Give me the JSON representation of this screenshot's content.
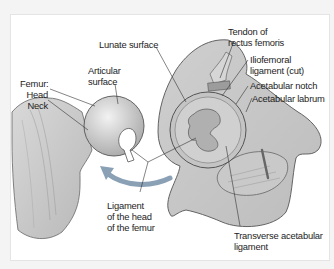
{
  "figure": {
    "arrow_color": "#8aa0b5",
    "labels": {
      "femur": "Femur:",
      "head": "Head",
      "neck": "Neck",
      "articular_surface_line1": "Articular",
      "articular_surface_line2": "surface",
      "lunate_surface": "Lunate surface",
      "tendon_line1": "Tendon of",
      "tendon_line2": "rectus femoris",
      "iliofemoral_line1": "Iliofemoral",
      "iliofemoral_line2": "ligament (cut)",
      "acetabular_notch": "Acetabular notch",
      "acetabular_labrum": "Acetabular labrum",
      "ligament_head_line1": "Ligament",
      "ligament_head_line2": "of the head",
      "ligament_head_line3": "of the femur",
      "transverse_line1": "Transverse acetabular",
      "transverse_line2": "ligament"
    }
  }
}
